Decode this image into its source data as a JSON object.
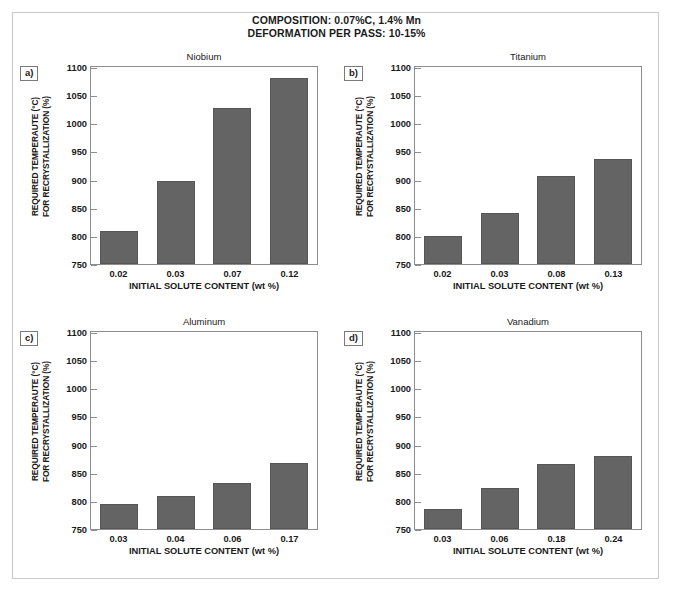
{
  "header": {
    "line1": "COMPOSITION: 0.07%C, 1.4% Mn",
    "line2": "DEFORMATION PER PASS: 10-15%"
  },
  "axis": {
    "ylabel_line1": "REQUIRED TEMPERAUTE (°C)",
    "ylabel_line2": "FOR RECRYSTALLIZATION (%)",
    "xlabel": "INITIAL SOLUTE CONTENT (wt %)",
    "yticks": [
      1100,
      1050,
      1000,
      950,
      900,
      850,
      800,
      750
    ],
    "ymin": 750,
    "ymax": 1100
  },
  "style": {
    "bar_fill": "#646464",
    "bar_stroke": "#565656",
    "frame": "#8d8d8d",
    "page_border": "#c9c9c9"
  },
  "panels": [
    {
      "tag": "a)",
      "title": "Niobium"
    },
    {
      "tag": "b)",
      "title": "Titanium"
    },
    {
      "tag": "c)",
      "title": "Aluminum"
    },
    {
      "tag": "d)",
      "title": "Vanadium"
    }
  ],
  "chart_data": [
    {
      "type": "bar",
      "title": "Niobium",
      "panel": "a)",
      "categories": [
        "0.02",
        "0.03",
        "0.07",
        "0.12"
      ],
      "values": [
        808,
        897,
        1028,
        1081
      ],
      "xlabel": "INITIAL SOLUTE CONTENT (wt %)",
      "ylabel": "REQUIRED TEMPERAUTE (°C) FOR RECRYSTALLIZATION (%)",
      "ylim": [
        750,
        1100
      ],
      "grid": false,
      "legend": "none"
    },
    {
      "type": "bar",
      "title": "Titanium",
      "panel": "b)",
      "categories": [
        "0.02",
        "0.03",
        "0.08",
        "0.13"
      ],
      "values": [
        799,
        840,
        907,
        936
      ],
      "xlabel": "INITIAL SOLUTE CONTENT (wt %)",
      "ylabel": "REQUIRED TEMPERAUTE (°C) FOR RECRYSTALLIZATION (%)",
      "ylim": [
        750,
        1100
      ],
      "grid": false,
      "legend": "none"
    },
    {
      "type": "bar",
      "title": "Aluminum",
      "panel": "c)",
      "categories": [
        "0.03",
        "0.04",
        "0.06",
        "0.17"
      ],
      "values": [
        795,
        809,
        832,
        868
      ],
      "xlabel": "INITIAL SOLUTE CONTENT (wt %)",
      "ylabel": "REQUIRED TEMPERAUTE (°C) FOR RECRYSTALLIZATION (%)",
      "ylim": [
        750,
        1100
      ],
      "grid": false,
      "legend": "none"
    },
    {
      "type": "bar",
      "title": "Vanadium",
      "panel": "d)",
      "categories": [
        "0.03",
        "0.06",
        "0.18",
        "0.24"
      ],
      "values": [
        786,
        822,
        866,
        879
      ],
      "xlabel": "INITIAL SOLUTE CONTENT (wt %)",
      "ylabel": "REQUIRED TEMPERAUTE (°C) FOR RECRYSTALLIZATION (%)",
      "ylim": [
        750,
        1100
      ],
      "grid": false,
      "legend": "none"
    }
  ]
}
